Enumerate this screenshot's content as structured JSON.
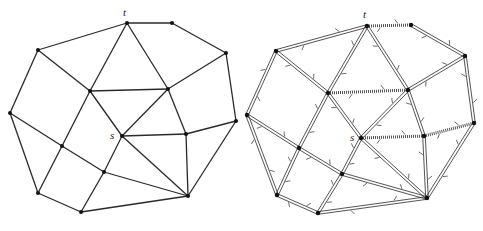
{
  "figure": {
    "colors": {
      "edge": "#2a2a2a",
      "node": "#111111",
      "hatch": "#555555",
      "background": "#ffffff"
    },
    "nodes_left": {
      "t": [
        127,
        23
      ],
      "A": [
        172,
        23
      ],
      "B": [
        226,
        53
      ],
      "C": [
        236,
        121
      ],
      "D": [
        38,
        50
      ],
      "E": [
        10,
        113
      ],
      "F": [
        38,
        193
      ],
      "G": [
        81,
        212
      ],
      "H": [
        90,
        91
      ],
      "I": [
        168,
        89
      ],
      "s": [
        122,
        136
      ],
      "J": [
        186,
        134
      ],
      "K": [
        62,
        146
      ],
      "L": [
        104,
        172
      ],
      "M": [
        188,
        196
      ]
    },
    "nodes_right": {
      "t": [
        367,
        26
      ],
      "A": [
        411,
        25
      ],
      "B": [
        465,
        56
      ],
      "C": [
        474,
        123
      ],
      "D": [
        276,
        51
      ],
      "E": [
        247,
        115
      ],
      "F": [
        277,
        195
      ],
      "G": [
        318,
        213
      ],
      "H": [
        328,
        93
      ],
      "I": [
        408,
        90
      ],
      "s": [
        361,
        138
      ],
      "J": [
        424,
        136
      ],
      "K": [
        299,
        148
      ],
      "L": [
        342,
        174
      ],
      "M": [
        427,
        198
      ]
    },
    "edges": [
      [
        "t",
        "A"
      ],
      [
        "A",
        "B"
      ],
      [
        "B",
        "C"
      ],
      [
        "C",
        "M"
      ],
      [
        "M",
        "G"
      ],
      [
        "G",
        "F"
      ],
      [
        "F",
        "E"
      ],
      [
        "E",
        "D"
      ],
      [
        "D",
        "t"
      ],
      [
        "t",
        "H"
      ],
      [
        "t",
        "I"
      ],
      [
        "D",
        "H"
      ],
      [
        "H",
        "I"
      ],
      [
        "I",
        "B"
      ],
      [
        "I",
        "J"
      ],
      [
        "J",
        "C"
      ],
      [
        "H",
        "s"
      ],
      [
        "I",
        "s"
      ],
      [
        "s",
        "J"
      ],
      [
        "s",
        "M"
      ],
      [
        "J",
        "M"
      ],
      [
        "s",
        "L"
      ],
      [
        "H",
        "K"
      ],
      [
        "E",
        "K"
      ],
      [
        "K",
        "L"
      ],
      [
        "L",
        "M"
      ],
      [
        "K",
        "F"
      ],
      [
        "L",
        "G"
      ]
    ],
    "hatched_edges_right": [
      [
        "t",
        "A"
      ],
      [
        "H",
        "I"
      ],
      [
        "s",
        "J"
      ],
      [
        "J",
        "C"
      ]
    ],
    "labels_left": {
      "t": "t",
      "s": "s"
    },
    "labels_right": {
      "t": "t",
      "s": "s"
    }
  }
}
